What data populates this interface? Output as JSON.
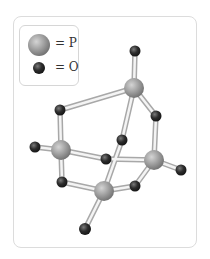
{
  "legend": {
    "items": [
      {
        "symbol": "phosphorus-sphere",
        "label": "= P",
        "color": "#9a9a9a"
      },
      {
        "symbol": "oxygen-sphere",
        "label": "= O",
        "color": "#2e2e2e"
      }
    ]
  },
  "molecule": {
    "name": "P4O10 cage",
    "atoms": {
      "P": [
        [
          134,
          88
        ],
        [
          61,
          150
        ],
        [
          154,
          160
        ],
        [
          104,
          191
        ]
      ],
      "O_terminal": [
        [
          135,
          51
        ],
        [
          35,
          147
        ],
        [
          181,
          170
        ],
        [
          85,
          229
        ]
      ],
      "O_bridging": [
        [
          60,
          110
        ],
        [
          122,
          140
        ],
        [
          156,
          116
        ],
        [
          106,
          159
        ],
        [
          62,
          182
        ],
        [
          135,
          186
        ]
      ]
    }
  }
}
